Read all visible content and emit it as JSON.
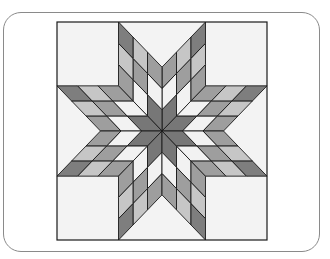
{
  "figure": {
    "title": "",
    "card": {
      "border_color": "#8a8a8a",
      "background": "#ffffff"
    },
    "quilt": {
      "square": {
        "x": 57,
        "y": 22,
        "width": 210,
        "height": 218
      },
      "center": {
        "x": 162,
        "y": 131
      },
      "background_color": "#f3f3f3",
      "outline_color": "#1a1a1a",
      "arms": 8,
      "grid_size": 3,
      "band_colors": [
        "#777777",
        "#f2f2f2",
        "#9e9e9e",
        "#c6c6c6",
        "#7e7e7e"
      ],
      "band_names": [
        "dark-center",
        "white",
        "medium-gray",
        "light-gray",
        "dark-tip"
      ]
    }
  }
}
